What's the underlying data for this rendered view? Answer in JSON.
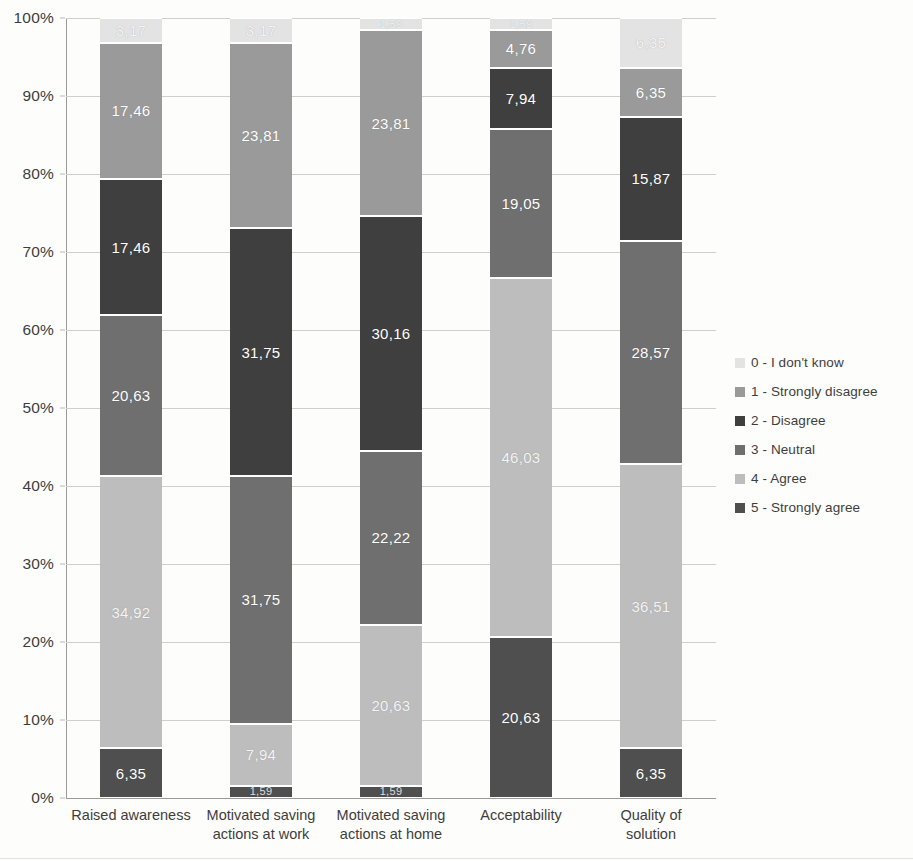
{
  "chart_data": {
    "type": "bar",
    "subtype": "100% stacked bar",
    "title": "",
    "xlabel": "",
    "ylabel": "",
    "ylim": [
      0,
      100
    ],
    "y_unit": "%",
    "grid": true,
    "legend_position": "right",
    "categories": [
      "Raised awareness",
      "Motivated saving actions at work",
      "Motivated saving actions at home",
      "Acceptability",
      "Quality of solution"
    ],
    "category_lines": [
      [
        "Raised awareness"
      ],
      [
        "Motivated saving",
        "actions at work"
      ],
      [
        "Motivated saving",
        "actions at home"
      ],
      [
        "Acceptability"
      ],
      [
        "Quality of",
        "solution"
      ]
    ],
    "y_ticks": [
      "0%",
      "10%",
      "20%",
      "30%",
      "40%",
      "50%",
      "60%",
      "70%",
      "80%",
      "90%",
      "100%"
    ],
    "y_tick_values": [
      0,
      10,
      20,
      30,
      40,
      50,
      60,
      70,
      80,
      90,
      100
    ],
    "series": [
      {
        "name": "5 - Strongly agree",
        "color": "#4f4f4f",
        "values": [
          6.35,
          1.59,
          1.59,
          20.63,
          6.35
        ],
        "labels": [
          "6,35",
          "1,59",
          "1,59",
          "20,63",
          "6,35"
        ]
      },
      {
        "name": "4 - Agree",
        "color": "#bdbdbd",
        "values": [
          34.92,
          7.94,
          20.63,
          46.03,
          36.51
        ],
        "labels": [
          "34,92",
          "7,94",
          "20,63",
          "46,03",
          "36,51"
        ]
      },
      {
        "name": "3 - Neutral",
        "color": "#6f6f6f",
        "values": [
          20.63,
          31.75,
          22.22,
          19.05,
          28.57
        ],
        "labels": [
          "20,63",
          "31,75",
          "22,22",
          "19,05",
          "28,57"
        ]
      },
      {
        "name": "2 - Disagree",
        "color": "#3f3f3f",
        "values": [
          17.46,
          31.75,
          30.16,
          7.94,
          15.87
        ],
        "labels": [
          "17,46",
          "31,75",
          "30,16",
          "7,94",
          "15,87"
        ]
      },
      {
        "name": "1 - Strongly disagree",
        "color": "#9a9a9a",
        "values": [
          17.46,
          23.81,
          23.81,
          4.76,
          6.35
        ],
        "labels": [
          "17,46",
          "23,81",
          "23,81",
          "4,76",
          "6,35"
        ]
      },
      {
        "name": "0 - I don't know",
        "color": "#e3e3e3",
        "values": [
          3.17,
          3.17,
          1.59,
          1.59,
          6.35
        ],
        "labels": [
          "3,17",
          "3,17",
          "1,59",
          "1,59",
          "6,35"
        ]
      }
    ],
    "legend_entries": [
      {
        "label": "0 - I don't know",
        "color": "#e3e3e3"
      },
      {
        "label": "1 - Strongly disagree",
        "color": "#9a9a9a"
      },
      {
        "label": "2 - Disagree",
        "color": "#3f3f3f"
      },
      {
        "label": "3 - Neutral",
        "color": "#6f6f6f"
      },
      {
        "label": "4 - Agree",
        "color": "#bdbdbd"
      },
      {
        "label": "5 - Strongly agree",
        "color": "#4f4f4f"
      }
    ]
  }
}
